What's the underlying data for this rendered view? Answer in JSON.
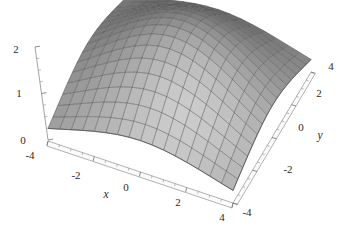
{
  "figure": {
    "type": "surface-plot-3d",
    "background_color": "#ffffff",
    "ink_color": "#2a2a2a",
    "mesh_color": "#4a4a4a",
    "axis_color": "#8f8f8f"
  },
  "axes": {
    "x": {
      "title": "x",
      "ticks": [
        -4,
        -2,
        0,
        2,
        4
      ],
      "tick_labels": [
        "-4",
        "-2",
        "0",
        "2",
        "4"
      ],
      "range": [
        -4,
        4
      ]
    },
    "y": {
      "title": "y",
      "ticks": [
        -4,
        -2,
        0,
        2,
        4
      ],
      "tick_labels": [
        "-4",
        "-2",
        "0",
        "2",
        "4"
      ],
      "range": [
        -4,
        4
      ]
    },
    "z": {
      "title": "",
      "ticks": [
        0,
        1,
        2
      ],
      "tick_labels": [
        "0",
        "1",
        "2"
      ],
      "range": [
        0,
        2
      ]
    }
  },
  "chart_data": {
    "type": "surface",
    "title": "",
    "xlabel": "x",
    "ylabel": "y",
    "zlabel": "",
    "xlim": [
      -4,
      4
    ],
    "ylim": [
      -4,
      4
    ],
    "zlim": [
      0,
      2
    ],
    "x_ticks": [
      -4,
      -2,
      0,
      2,
      4
    ],
    "y_ticks": [
      -4,
      -2,
      0,
      2,
      4
    ],
    "z_ticks": [
      0,
      1,
      2
    ],
    "grid": true,
    "legend": "none",
    "colormap": "grayscale",
    "shading": "smooth-lighting",
    "mesh_divisions_x": 16,
    "mesh_divisions_y": 16,
    "surface_description": "Single-peaked dome (Gaussian-like bump) centered at x=0, y=0, peaking at z=2 and decaying toward 0 at the domain corners.",
    "peak": {
      "x": 0,
      "y": 0,
      "z": 2
    },
    "x": [
      -4,
      -3.5,
      -3,
      -2.5,
      -2,
      -1.5,
      -1,
      -0.5,
      0,
      0.5,
      1,
      1.5,
      2,
      2.5,
      3,
      3.5,
      4
    ],
    "y": [
      -4,
      -3.5,
      -3,
      -2.5,
      -2,
      -1.5,
      -1,
      -0.5,
      0,
      0.5,
      1,
      1.5,
      2,
      2.5,
      3,
      3.5,
      4
    ],
    "z_formula": "2*exp(-(x^2 + y^2)/8)",
    "z": [
      [
        0.27,
        0.339,
        0.409,
        0.478,
        0.541,
        0.595,
        0.638,
        0.665,
        0.675,
        0.665,
        0.638,
        0.595,
        0.541,
        0.478,
        0.409,
        0.339,
        0.27
      ],
      [
        0.339,
        0.425,
        0.513,
        0.599,
        0.678,
        0.746,
        0.8,
        0.834,
        0.846,
        0.834,
        0.8,
        0.746,
        0.678,
        0.599,
        0.513,
        0.425,
        0.339
      ],
      [
        0.409,
        0.513,
        0.619,
        0.723,
        0.819,
        0.901,
        0.966,
        1.007,
        1.021,
        1.007,
        0.966,
        0.901,
        0.819,
        0.723,
        0.619,
        0.513,
        0.409
      ],
      [
        0.478,
        0.599,
        0.723,
        0.845,
        0.956,
        1.052,
        1.128,
        1.176,
        1.193,
        1.176,
        1.128,
        1.052,
        0.956,
        0.845,
        0.723,
        0.599,
        0.478
      ],
      [
        0.541,
        0.678,
        0.819,
        0.956,
        1.083,
        1.191,
        1.277,
        1.331,
        1.35,
        1.331,
        1.277,
        1.191,
        1.083,
        0.956,
        0.819,
        0.678,
        0.541
      ],
      [
        0.595,
        0.746,
        0.901,
        1.052,
        1.191,
        1.311,
        1.405,
        1.465,
        1.485,
        1.465,
        1.405,
        1.311,
        1.191,
        1.052,
        0.901,
        0.746,
        0.595
      ],
      [
        0.638,
        0.8,
        0.966,
        1.128,
        1.277,
        1.405,
        1.507,
        1.571,
        1.593,
        1.571,
        1.507,
        1.405,
        1.277,
        1.128,
        0.966,
        0.8,
        0.638
      ],
      [
        0.665,
        0.834,
        1.007,
        1.176,
        1.331,
        1.465,
        1.571,
        1.638,
        1.661,
        1.638,
        1.571,
        1.465,
        1.331,
        1.176,
        1.007,
        0.834,
        0.665
      ],
      [
        0.675,
        0.846,
        1.021,
        1.193,
        1.35,
        1.485,
        1.593,
        1.661,
        1.684,
        1.661,
        1.593,
        1.485,
        1.35,
        1.193,
        1.021,
        0.846,
        0.675
      ],
      [
        0.665,
        0.834,
        1.007,
        1.176,
        1.331,
        1.465,
        1.571,
        1.638,
        1.661,
        1.638,
        1.571,
        1.465,
        1.331,
        1.176,
        1.007,
        0.834,
        0.665
      ],
      [
        0.638,
        0.8,
        0.966,
        1.128,
        1.277,
        1.405,
        1.507,
        1.571,
        1.593,
        1.571,
        1.507,
        1.405,
        1.277,
        1.128,
        0.966,
        0.8,
        0.638
      ],
      [
        0.595,
        0.746,
        0.901,
        1.052,
        1.191,
        1.311,
        1.405,
        1.465,
        1.485,
        1.465,
        1.405,
        1.311,
        1.191,
        1.052,
        0.901,
        0.746,
        0.595
      ],
      [
        0.541,
        0.678,
        0.819,
        0.956,
        1.083,
        1.191,
        1.277,
        1.331,
        1.35,
        1.331,
        1.277,
        1.191,
        1.083,
        0.956,
        0.819,
        0.678,
        0.541
      ],
      [
        0.478,
        0.599,
        0.723,
        0.845,
        0.956,
        1.052,
        1.128,
        1.176,
        1.193,
        1.176,
        1.128,
        1.052,
        0.956,
        0.845,
        0.723,
        0.599,
        0.478
      ],
      [
        0.409,
        0.513,
        0.619,
        0.723,
        0.819,
        0.901,
        0.966,
        1.007,
        1.021,
        1.007,
        0.966,
        0.901,
        0.819,
        0.723,
        0.619,
        0.513,
        0.409
      ],
      [
        0.339,
        0.425,
        0.513,
        0.599,
        0.678,
        0.746,
        0.8,
        0.834,
        0.846,
        0.834,
        0.8,
        0.746,
        0.678,
        0.599,
        0.513,
        0.425,
        0.339
      ],
      [
        0.27,
        0.339,
        0.409,
        0.478,
        0.541,
        0.595,
        0.638,
        0.665,
        0.675,
        0.665,
        0.638,
        0.595,
        0.541,
        0.478,
        0.409,
        0.339,
        0.27
      ]
    ]
  },
  "labels": {
    "x_title": "x",
    "y_title": "y",
    "x_m4": "-4",
    "x_m2": "-2",
    "x_0": "0",
    "x_2": "2",
    "x_4": "4",
    "y_m4": "-4",
    "y_m2": "-2",
    "y_0": "0",
    "y_2": "2",
    "y_4": "4",
    "z_0": "0",
    "z_1": "1",
    "z_2": "2"
  }
}
